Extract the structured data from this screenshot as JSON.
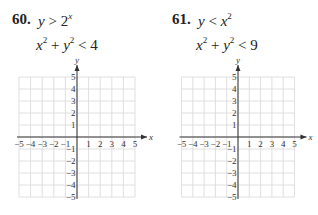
{
  "problems": [
    {
      "number": "60.",
      "ineq1": {
        "lhs": "y",
        "op": ">",
        "rhs_base": "2",
        "rhs_exp": "x"
      },
      "ineq2": {
        "a": "x",
        "a_exp": "2",
        "plus": "+",
        "b": "y",
        "b_exp": "2",
        "op": "<",
        "rhs": "4"
      }
    },
    {
      "number": "61.",
      "ineq1": {
        "lhs": "y",
        "op": "<",
        "rhs_base": "x",
        "rhs_exp": "2"
      },
      "ineq2": {
        "a": "x",
        "a_exp": "2",
        "plus": "+",
        "b": "y",
        "b_exp": "2",
        "op": "<",
        "rhs": "9"
      }
    }
  ],
  "graph": {
    "x_label": "x",
    "y_label": "y",
    "x_ticks": [
      "−5",
      "−4",
      "−3",
      "−2",
      "−1",
      "1",
      "2",
      "3",
      "4",
      "5"
    ],
    "y_ticks": [
      "5",
      "4",
      "3",
      "2",
      "1",
      "−1",
      "−2",
      "−3",
      "−4",
      "−5"
    ],
    "range": [
      -5,
      5
    ],
    "grid_color": "#d8d8d8",
    "axis_color": "#333333"
  }
}
